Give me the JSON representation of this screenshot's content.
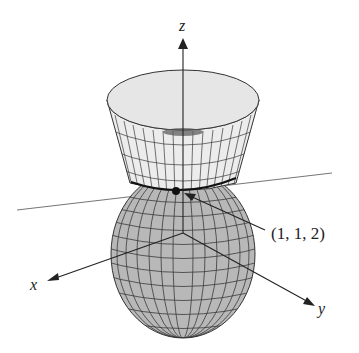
{
  "figure": {
    "axes": {
      "x_label": "x",
      "y_label": "y",
      "z_label": "z"
    },
    "point_label": "(1, 1, 2)",
    "colors": {
      "ellipsoid_fill": "#b8b8b8",
      "cone_fill": "#ececec",
      "grid": "#3a3a3a",
      "axis": "#222222",
      "tangent_line": "#777777"
    }
  }
}
